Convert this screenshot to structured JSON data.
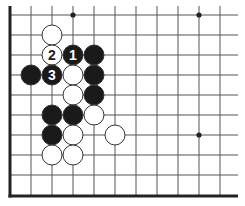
{
  "diagram": {
    "type": "go-board-fragment",
    "colors": {
      "background": "#ffffff",
      "grid_line": "#555555",
      "edge_line": "#222222",
      "black_stone": "#1a1a1a",
      "white_stone": "#ffffff",
      "stone_outline": "#333333",
      "black_label": "#ffffff",
      "white_label": "#1a1a1a"
    },
    "grid": {
      "x": [
        10,
        31,
        52,
        73,
        94,
        115,
        136,
        157,
        178,
        199,
        220
      ],
      "y": [
        15,
        35,
        55,
        75,
        95,
        115,
        135,
        155,
        175,
        196
      ],
      "extend_right_to": 238,
      "extend_top_to": 6,
      "edges": [
        "left",
        "bottom"
      ]
    },
    "star_points": [
      {
        "col": 3,
        "row": 0
      },
      {
        "col": 9,
        "row": 0
      },
      {
        "col": 9,
        "row": 6
      }
    ],
    "stones": [
      {
        "col": 2,
        "row": 1,
        "color": "white",
        "label": ""
      },
      {
        "col": 2,
        "row": 2,
        "color": "white",
        "label": "2"
      },
      {
        "col": 3,
        "row": 2,
        "color": "black",
        "label": "1"
      },
      {
        "col": 4,
        "row": 2,
        "color": "black",
        "label": ""
      },
      {
        "col": 1,
        "row": 3,
        "color": "black",
        "label": ""
      },
      {
        "col": 2,
        "row": 3,
        "color": "black",
        "label": "3"
      },
      {
        "col": 3,
        "row": 3,
        "color": "white",
        "label": ""
      },
      {
        "col": 4,
        "row": 3,
        "color": "black",
        "label": ""
      },
      {
        "col": 3,
        "row": 4,
        "color": "white",
        "label": ""
      },
      {
        "col": 4,
        "row": 4,
        "color": "black",
        "label": ""
      },
      {
        "col": 2,
        "row": 5,
        "color": "black",
        "label": ""
      },
      {
        "col": 3,
        "row": 5,
        "color": "black",
        "label": ""
      },
      {
        "col": 4,
        "row": 5,
        "color": "white",
        "label": ""
      },
      {
        "col": 2,
        "row": 6,
        "color": "black",
        "label": ""
      },
      {
        "col": 3,
        "row": 6,
        "color": "white",
        "label": ""
      },
      {
        "col": 5,
        "row": 6,
        "color": "white",
        "label": ""
      },
      {
        "col": 2,
        "row": 7,
        "color": "white",
        "label": ""
      },
      {
        "col": 3,
        "row": 7,
        "color": "white",
        "label": ""
      }
    ],
    "move_labels": [
      "1",
      "2",
      "3"
    ]
  }
}
